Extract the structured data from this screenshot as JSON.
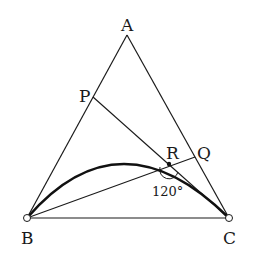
{
  "diagram": {
    "type": "geometry",
    "points": {
      "A": {
        "label": "A",
        "x": 127,
        "y": 35
      },
      "B": {
        "label": "B",
        "x": 27,
        "y": 218
      },
      "C": {
        "label": "C",
        "x": 229,
        "y": 218
      },
      "P": {
        "label": "P",
        "x": 93,
        "y": 97
      },
      "Q": {
        "label": "Q",
        "x": 195,
        "y": 157
      },
      "R": {
        "label": "R",
        "x": 169,
        "y": 164
      }
    },
    "segments": [
      "AB",
      "AC",
      "BC",
      "PC",
      "BQ"
    ],
    "arc": {
      "from": "B",
      "to": "C",
      "through": "R",
      "style": "bold"
    },
    "angle_label": "120°",
    "colors": {
      "line": "#1a1a1a",
      "background": "#ffffff"
    }
  }
}
